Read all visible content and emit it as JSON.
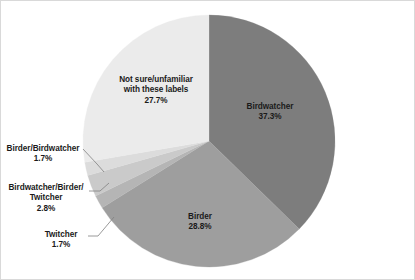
{
  "chart_data": {
    "type": "pie",
    "title": "",
    "categories": [
      "Birdwatcher",
      "Birder",
      "Twitcher",
      "Birdwatcher/Birder/Twitcher",
      "Birder/Birdwatcher",
      "Not sure/unfamiliar with these labels"
    ],
    "values": [
      37.3,
      28.8,
      1.7,
      2.8,
      1.7,
      27.7
    ],
    "value_labels": [
      "37.3%",
      "28.8%",
      "1.7%",
      "2.8%",
      "1.7%",
      "27.7%"
    ],
    "colors": [
      "#7d7d7d",
      "#9e9e9e",
      "#b5b5b5",
      "#cacaca",
      "#dcdcdc",
      "#ebebeb"
    ],
    "unit": "%",
    "legend": "none",
    "grid": false,
    "start_angle_deg": 0,
    "direction": "clockwise",
    "slices": [
      {
        "name": "Birdwatcher",
        "value": 37.3,
        "percent_text": "37.3%",
        "color": "#7d7d7d",
        "label_text": "Birdwatcher\n37.3%",
        "label_placement": "inside"
      },
      {
        "name": "Birder",
        "value": 28.8,
        "percent_text": "28.8%",
        "color": "#9e9e9e",
        "label_text": "Birder\n28.8%",
        "label_placement": "inside"
      },
      {
        "name": "Twitcher",
        "value": 1.7,
        "percent_text": "1.7%",
        "color": "#b5b5b5",
        "label_text": "Twitcher\n1.7%",
        "label_placement": "callout"
      },
      {
        "name": "Birdwatcher/Birder/Twitcher",
        "value": 2.8,
        "percent_text": "2.8%",
        "color": "#cacaca",
        "label_text": "Birdwatcher/Birder/\nTwitcher\n2.8%",
        "label_placement": "callout"
      },
      {
        "name": "Birder/Birdwatcher",
        "value": 1.7,
        "percent_text": "1.7%",
        "color": "#dcdcdc",
        "label_text": "Birder/Birdwatcher\n1.7%",
        "label_placement": "callout"
      },
      {
        "name": "Not sure/unfamiliar with these labels",
        "value": 27.7,
        "percent_text": "27.7%",
        "color": "#ebebeb",
        "label_text": "Not sure/unfamiliar\nwith these labels\n27.7%",
        "label_placement": "inside"
      }
    ]
  },
  "frame": {
    "border_color": "#d9d9d9",
    "background": "#ffffff"
  }
}
